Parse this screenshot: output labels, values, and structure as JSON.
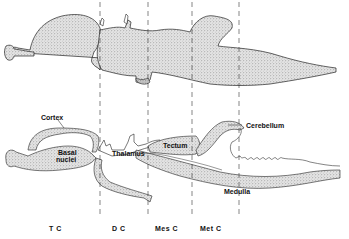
{
  "figure": {
    "colors": {
      "ink": "#111111",
      "stipple_fill": "#d8d8d8",
      "background": "#ffffff"
    },
    "structure_labels": {
      "cortex": "Cortex",
      "basal_nuclei_line1": "Basal",
      "basal_nuclei_line2": "nuclei",
      "thalamus": "Thalamus",
      "tectum": "Tectum",
      "cerebellum": "Cerebellum",
      "medulla": "Medulla"
    },
    "region_labels": {
      "tc": "T C",
      "dc": "D C",
      "mes_c": "Mes C",
      "met_c": "Met C"
    },
    "dividers_x": [
      100,
      148,
      192,
      239
    ]
  }
}
